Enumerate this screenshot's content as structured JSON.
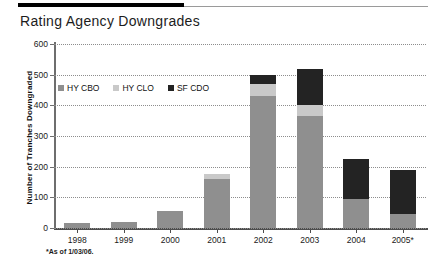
{
  "header": {
    "title": "Rating Agency Downgrades"
  },
  "footnote": "*As of 1/03/06.",
  "colors": {
    "hy_cbo": "#8f8f8f",
    "hy_clo": "#c9c9c9",
    "sf_cdo": "#232323",
    "axis": "#4d4d4d",
    "grid": "#8d8d8d",
    "rule": "#000000"
  },
  "chart_data": {
    "type": "bar",
    "title": "Rating Agency Downgrades",
    "subtitle": "",
    "xlabel": "",
    "ylabel": "Number of Tranches Downgraded",
    "stacked": true,
    "grid": true,
    "legend_position": "inside-top-left",
    "ylim": [
      0,
      600
    ],
    "yticks": [
      0,
      100,
      200,
      300,
      400,
      500,
      600
    ],
    "ytick_labels": [
      "0",
      "100",
      "200",
      "300",
      "400",
      "500",
      "600"
    ],
    "categories": [
      "1998",
      "1999",
      "2000",
      "2001",
      "2002",
      "2003",
      "2004",
      "2005*"
    ],
    "series": [
      {
        "name": "HY CBO",
        "color": "#8f8f8f",
        "values": [
          15,
          18,
          57,
          160,
          430,
          365,
          95,
          45
        ]
      },
      {
        "name": "HY CLO",
        "color": "#c9c9c9",
        "values": [
          0,
          0,
          0,
          15,
          40,
          35,
          0,
          0
        ]
      },
      {
        "name": "SF CDO",
        "color": "#232323",
        "values": [
          0,
          0,
          0,
          0,
          30,
          120,
          130,
          145
        ]
      }
    ],
    "totals": [
      15,
      18,
      57,
      175,
      500,
      520,
      225,
      190
    ],
    "annotations": [
      "*As of 1/03/06."
    ]
  },
  "legend": {
    "items": [
      {
        "label": "HY CBO"
      },
      {
        "label": "HY CLO"
      },
      {
        "label": "SF CDO"
      }
    ]
  }
}
